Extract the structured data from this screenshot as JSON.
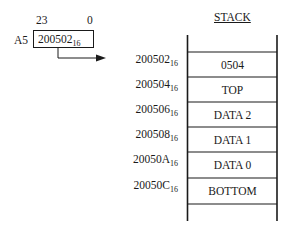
{
  "register": {
    "name": "A5",
    "bit_high": "23",
    "bit_low": "0",
    "value": "200502",
    "value_base": "16"
  },
  "stack": {
    "title": "STACK",
    "rows": [
      {
        "address": "200502",
        "base": "16",
        "content": "0504"
      },
      {
        "address": "200504",
        "base": "16",
        "content": "TOP"
      },
      {
        "address": "200506",
        "base": "16",
        "content": "DATA 2"
      },
      {
        "address": "200508",
        "base": "16",
        "content": "DATA 1"
      },
      {
        "address": "20050A",
        "base": "16",
        "content": "DATA 0"
      },
      {
        "address": "20050C",
        "base": "16",
        "content": "BOTTOM"
      }
    ]
  },
  "colors": {
    "line": "#1a1a1a",
    "background": "#ffffff"
  }
}
